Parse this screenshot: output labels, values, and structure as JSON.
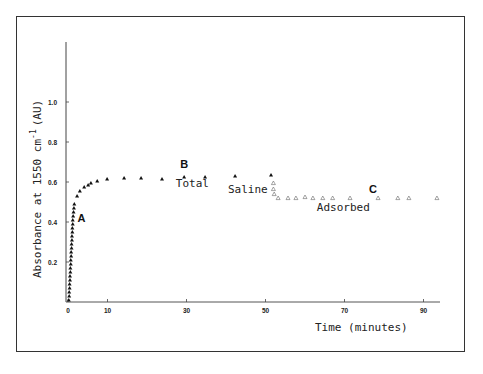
{
  "chart_data": {
    "type": "scatter",
    "title": "",
    "xlabel": "Time (minutes)",
    "ylabel": "Absorbance at 1550 cm-1 (AU)",
    "ylabel_parts": {
      "main": "Absorbance at 1550 cm",
      "sup": "-1",
      "unit": "(AU)"
    },
    "xlim": [
      0,
      95
    ],
    "ylim": [
      0,
      1.2
    ],
    "x_ticks": [
      0,
      10,
      30,
      50,
      70,
      90
    ],
    "y_ticks": [
      0.2,
      0.4,
      0.6,
      0.8,
      1.0
    ],
    "y_tick_labels": [
      "0.2",
      "0.4",
      "0.6",
      "0.8",
      "1.0"
    ],
    "x_tick_labels": [
      "0",
      "10",
      "30",
      "50",
      "70",
      "90"
    ],
    "grid": false,
    "series": [
      {
        "name": "Total",
        "marker": "filled-triangle",
        "points": [
          [
            0.2,
            0.01
          ],
          [
            0.3,
            0.03
          ],
          [
            0.3,
            0.05
          ],
          [
            0.4,
            0.07
          ],
          [
            0.4,
            0.09
          ],
          [
            0.5,
            0.11
          ],
          [
            0.5,
            0.13
          ],
          [
            0.6,
            0.15
          ],
          [
            0.6,
            0.17
          ],
          [
            0.7,
            0.19
          ],
          [
            0.7,
            0.21
          ],
          [
            0.8,
            0.23
          ],
          [
            0.8,
            0.25
          ],
          [
            0.9,
            0.27
          ],
          [
            0.9,
            0.29
          ],
          [
            1.0,
            0.31
          ],
          [
            1.0,
            0.33
          ],
          [
            1.1,
            0.35
          ],
          [
            1.1,
            0.37
          ],
          [
            1.2,
            0.39
          ],
          [
            1.2,
            0.41
          ],
          [
            1.3,
            0.43
          ],
          [
            1.4,
            0.45
          ],
          [
            1.5,
            0.47
          ],
          [
            1.6,
            0.49
          ],
          [
            2.3,
            0.53
          ],
          [
            3.0,
            0.555
          ],
          [
            4.1,
            0.575
          ],
          [
            5.1,
            0.585
          ],
          [
            5.8,
            0.595
          ],
          [
            7.4,
            0.605
          ],
          [
            9.9,
            0.615
          ],
          [
            14.2,
            0.62
          ],
          [
            18.5,
            0.62
          ],
          [
            23.8,
            0.615
          ],
          [
            29.4,
            0.625
          ],
          [
            34.7,
            0.625
          ],
          [
            42.3,
            0.63
          ],
          [
            51.4,
            0.635
          ]
        ]
      },
      {
        "name": "Adsorbed",
        "marker": "hollow-triangle",
        "points": [
          [
            52.0,
            0.595
          ],
          [
            52.0,
            0.565
          ],
          [
            52.2,
            0.54
          ],
          [
            53.2,
            0.52
          ],
          [
            55.7,
            0.52
          ],
          [
            57.7,
            0.52
          ],
          [
            60.0,
            0.525
          ],
          [
            62.0,
            0.52
          ],
          [
            64.5,
            0.52
          ],
          [
            67.0,
            0.52
          ],
          [
            71.4,
            0.52
          ],
          [
            78.5,
            0.52
          ],
          [
            83.5,
            0.52
          ],
          [
            86.3,
            0.52
          ],
          [
            93.4,
            0.52
          ]
        ]
      }
    ],
    "annotations": [
      {
        "text": "A",
        "x": 2.4,
        "y": 0.4,
        "style": "bold"
      },
      {
        "text": "B",
        "x": 28.4,
        "y": 0.67,
        "style": "bold"
      },
      {
        "text": "C",
        "x": 76.2,
        "y": 0.545,
        "style": "bold"
      },
      {
        "text": "Total",
        "x": 27.3,
        "y": 0.575,
        "style": "normal"
      },
      {
        "text": "Saline",
        "x": 40.5,
        "y": 0.545,
        "style": "normal"
      },
      {
        "text": "Adsorbed",
        "x": 63.0,
        "y": 0.455,
        "style": "normal"
      }
    ]
  },
  "layout": {
    "x_origin_px": 68,
    "x_px_per_unit": 3.95,
    "y_origin_px": 302,
    "y_px_per_unit": 200,
    "y_axis_top_px": 42,
    "x_axis_right_px": 440
  }
}
